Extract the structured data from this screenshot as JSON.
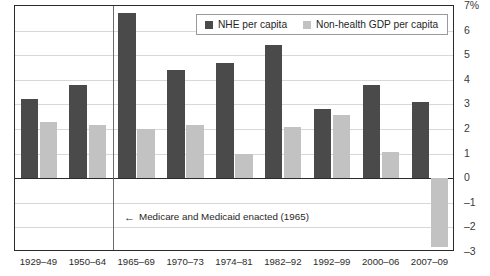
{
  "chart_data": {
    "type": "bar",
    "title": "",
    "xlabel": "",
    "ylabel": "%",
    "ylim": [
      -3,
      7
    ],
    "yticks": [
      "7%",
      "6",
      "5",
      "4",
      "3",
      "2",
      "1",
      "0",
      "-1",
      "-2",
      "-3"
    ],
    "grid": true,
    "legend_position": "top-center",
    "categories": [
      "1929–49",
      "1950–64",
      "1965–69",
      "1970–73",
      "1974–81",
      "1982–92",
      "1992–99",
      "2000–06",
      "2007–09"
    ],
    "series": [
      {
        "name": "NHE per capita",
        "color": "#4a4a4a",
        "values": [
          3.2,
          3.8,
          6.7,
          4.4,
          4.7,
          5.4,
          2.8,
          3.8,
          3.1
        ]
      },
      {
        "name": "Non-health GDP per capita",
        "color": "#c2c2c2",
        "values": [
          2.3,
          2.15,
          2.0,
          2.15,
          1.0,
          2.1,
          2.55,
          1.05,
          -2.8
        ]
      }
    ],
    "annotations": [
      {
        "arrow": "←",
        "text": "Medicare and Medicaid enacted (1965)",
        "at_category": "1965–69"
      }
    ]
  },
  "legend": {
    "items": [
      {
        "label": "NHE per capita",
        "swatch": "dark-square-swatch"
      },
      {
        "label": "Non-health GDP per capita",
        "swatch": "light-square-swatch"
      }
    ]
  },
  "axis": {
    "y_unit_label": "7%",
    "ticks": [
      "7%",
      "6",
      "5",
      "4",
      "3",
      "2",
      "1",
      "0",
      "–1",
      "–2",
      "–3"
    ]
  },
  "colors": {
    "nhe_bar": "#4a4a4a",
    "gdp_bar": "#c2c2c2",
    "frame": "#2b2b2b",
    "gridline": "#d8d8d8",
    "divider": "#6b6b6b"
  }
}
